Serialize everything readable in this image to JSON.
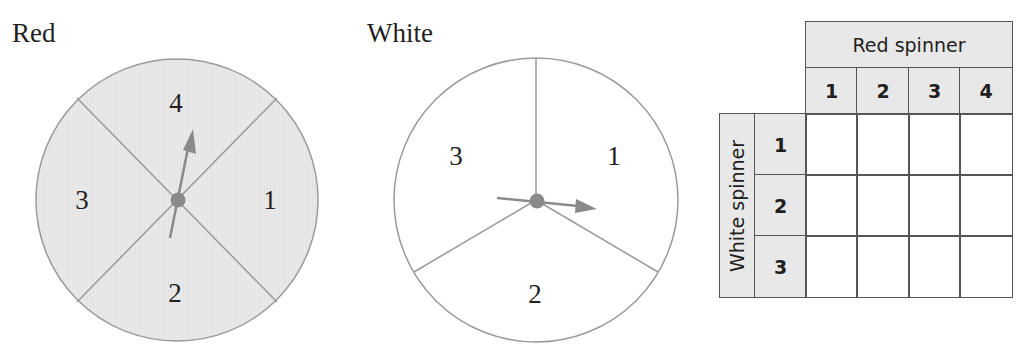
{
  "red_spinner": {
    "title": "Red",
    "fill_color": "#e8e8e8",
    "sections": [
      {
        "label": "1",
        "position": "right"
      },
      {
        "label": "2",
        "position": "bottom"
      },
      {
        "label": "3",
        "position": "left"
      },
      {
        "label": "4",
        "position": "top"
      }
    ],
    "arrow_points_to": "4"
  },
  "white_spinner": {
    "title": "White",
    "fill_color": "#ffffff",
    "sections": [
      {
        "label": "1",
        "position": "upper-right"
      },
      {
        "label": "2",
        "position": "bottom"
      },
      {
        "label": "3",
        "position": "upper-left"
      }
    ],
    "arrow_points_to": "1"
  },
  "outcome_table": {
    "column_header": "Red spinner",
    "row_header": "White spinner",
    "columns": [
      "1",
      "2",
      "3",
      "4"
    ],
    "rows": [
      "1",
      "2",
      "3"
    ],
    "cells": [
      [
        "",
        "",
        "",
        ""
      ],
      [
        "",
        "",
        "",
        ""
      ],
      [
        "",
        "",
        "",
        ""
      ]
    ]
  },
  "colors": {
    "line": "#9a9a9a",
    "pointer": "#8a8a8a",
    "shade": "#e8e8e8",
    "text": "#231f20",
    "table_border": "#555555"
  }
}
